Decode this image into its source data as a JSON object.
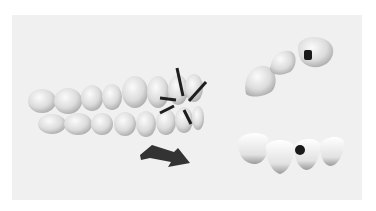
{
  "figure": {
    "panel_color": "#f0f0f0",
    "tooth_color": "#e6e6e6",
    "vector_color": "#1e1e1e",
    "arrow_color": "#333333",
    "marker_color": "#1a1a1a"
  }
}
